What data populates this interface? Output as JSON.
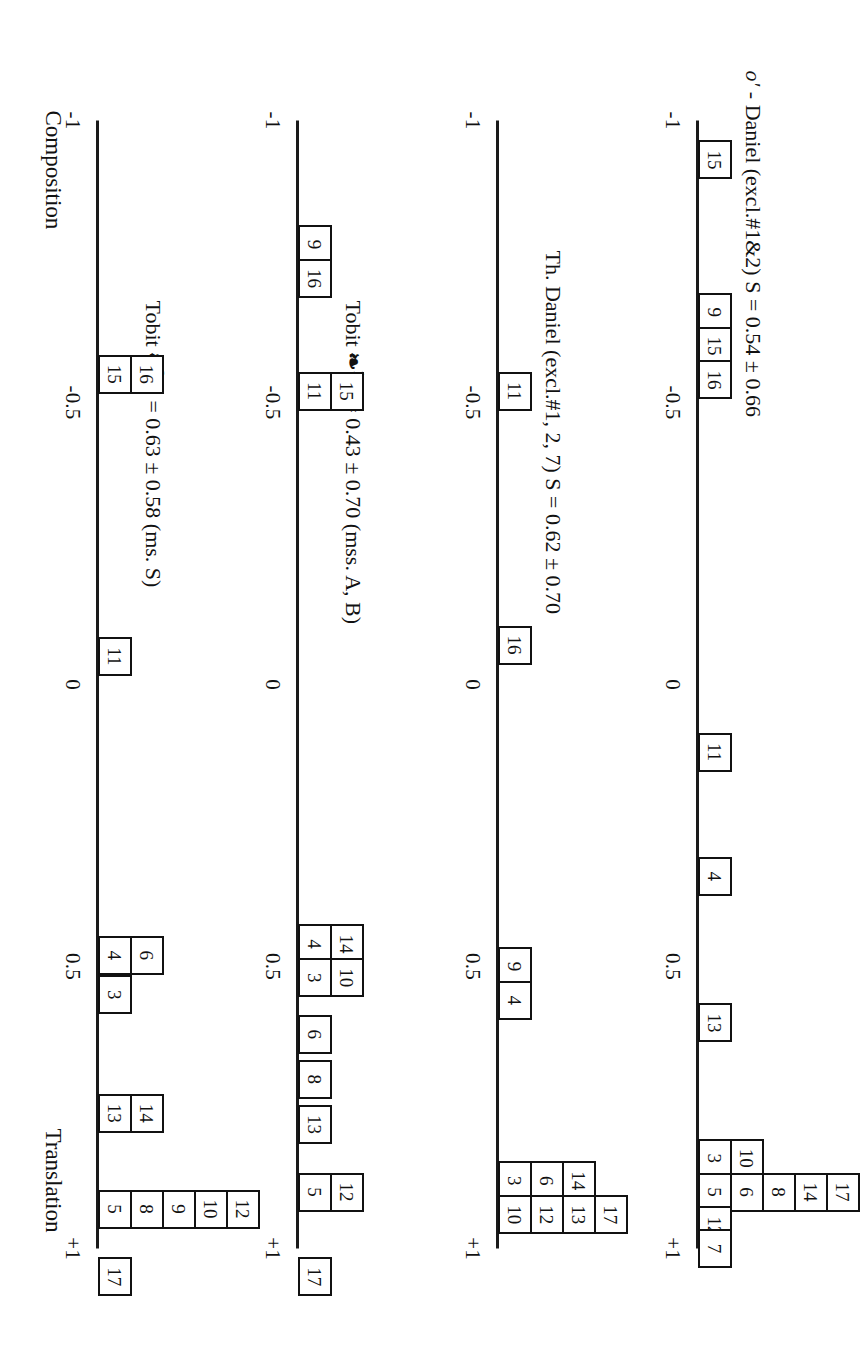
{
  "figure": {
    "orientation_note": "rotated",
    "left_end_label": "Composition",
    "right_end_label": "Translation",
    "axis_ticks": [
      "-1",
      "-0.5",
      "0",
      "0.5",
      "+1"
    ],
    "axis_tick_values": [
      -1,
      -0.5,
      0,
      0.5,
      1
    ]
  },
  "panels": [
    {
      "id": "panel-1",
      "title_prefix": "o′",
      "title_rest": "- Daniel (excl.#1&2)   S =   0.54 ± 0.66",
      "title_full": "o′ - Daniel (excl.#1&2)   S =   0.54 ± 0.66",
      "score": "0.54",
      "sd": "0.66"
    },
    {
      "id": "panel-2",
      "title_prefix": "",
      "title_rest": "Th. Daniel (excl.#1, 2, 7)   S = 0.62  ± 0.70",
      "title_full": "Th. Daniel (excl.#1, 2, 7)   S = 0.62  ± 0.70",
      "score": "0.62",
      "sd": "0.70"
    },
    {
      "id": "panel-3",
      "title_prefix": "Tobit",
      "title_mark": "❧",
      "title_sup": "1",
      "title_rest": "S = 0.43 ± 0.70      (mss. A, B)",
      "title_full": "Tobit ❧1  S = 0.43 ± 0.70      (mss. A, B)",
      "score": "0.43",
      "sd": "0.70",
      "note": "(mss. A, B)"
    },
    {
      "id": "panel-4",
      "title_prefix": "Tobit",
      "title_mark": "❧",
      "title_sup": "2",
      "title_rest": "S = 0.63 ± 0.58     (ms. S)",
      "title_full": "Tobit ❧2  S = 0.63 ± 0.58     (ms. S)",
      "score": "0.63",
      "sd": "0.58",
      "note": "(ms. S)"
    }
  ],
  "chart_data": {
    "type": "bar",
    "xlabel": "",
    "ylabel": "",
    "xlim": [
      -1,
      1
    ],
    "grid": false,
    "legend": "none",
    "xtick_labels": [
      "-1",
      "-0.5",
      "0",
      "0.5",
      "+1"
    ],
    "xtick_values": [
      -1,
      -0.5,
      0,
      0.5,
      1
    ],
    "axis_end_labels": {
      "left": "Composition",
      "right": "Translation"
    },
    "series": [
      {
        "name": "o′ - Daniel (excl.#1&2)",
        "S": 0.54,
        "sd": 0.66,
        "stacks": [
          {
            "x": -0.93,
            "labels": [
              "15"
            ]
          },
          {
            "x": -0.66,
            "labels": [
              "9"
            ]
          },
          {
            "x": -0.6,
            "labels": [
              "15"
            ]
          },
          {
            "x": -0.54,
            "labels": [
              "16"
            ]
          },
          {
            "x": 0.12,
            "labels": [
              "11"
            ]
          },
          {
            "x": 0.34,
            "labels": [
              "4"
            ]
          },
          {
            "x": 0.6,
            "labels": [
              "13"
            ]
          },
          {
            "x": 0.84,
            "labels": [
              "3",
              "10"
            ]
          },
          {
            "x": 0.9,
            "labels": [
              "5",
              "6",
              "8",
              "14",
              "17"
            ]
          },
          {
            "x": 0.96,
            "labels": [
              "12"
            ]
          },
          {
            "x": 1.0,
            "labels": [
              "7"
            ]
          }
        ]
      },
      {
        "name": "Th. Daniel (excl.#1, 2, 7)",
        "S": 0.62,
        "sd": 0.7,
        "stacks": [
          {
            "x": -0.52,
            "labels": [
              "11"
            ]
          },
          {
            "x": -0.07,
            "labels": [
              "16"
            ]
          },
          {
            "x": 0.5,
            "labels": [
              "9"
            ]
          },
          {
            "x": 0.56,
            "labels": [
              "4"
            ]
          },
          {
            "x": 0.88,
            "labels": [
              "3",
              "6",
              "14"
            ]
          },
          {
            "x": 0.94,
            "labels": [
              "10",
              "12",
              "13",
              "17"
            ]
          }
        ]
      },
      {
        "name": "Tobit ❧1 (mss. A, B)",
        "S": 0.43,
        "sd": 0.7,
        "stacks": [
          {
            "x": -0.78,
            "labels": [
              "9"
            ]
          },
          {
            "x": -0.72,
            "labels": [
              "16"
            ]
          },
          {
            "x": -0.52,
            "labels": [
              "11",
              "15"
            ]
          },
          {
            "x": 0.46,
            "labels": [
              "4",
              "14"
            ]
          },
          {
            "x": 0.52,
            "labels": [
              "3",
              "10"
            ]
          },
          {
            "x": 0.62,
            "labels": [
              "6"
            ]
          },
          {
            "x": 0.7,
            "labels": [
              "8"
            ]
          },
          {
            "x": 0.78,
            "labels": [
              "13"
            ]
          },
          {
            "x": 0.9,
            "labels": [
              "5",
              "12"
            ]
          },
          {
            "x": 1.05,
            "labels": [
              "17"
            ]
          }
        ]
      },
      {
        "name": "Tobit ❧2 (ms. S)",
        "S": 0.63,
        "sd": 0.58,
        "stacks": [
          {
            "x": -0.55,
            "labels": [
              "15",
              "16"
            ]
          },
          {
            "x": -0.05,
            "labels": [
              "11"
            ]
          },
          {
            "x": 0.48,
            "labels": [
              "4",
              "6"
            ]
          },
          {
            "x": 0.55,
            "labels": [
              "3"
            ]
          },
          {
            "x": 0.76,
            "labels": [
              "13",
              "14"
            ]
          },
          {
            "x": 0.93,
            "labels": [
              "5",
              "8",
              "9",
              "10",
              "12"
            ]
          },
          {
            "x": 1.05,
            "labels": [
              "17"
            ]
          }
        ]
      }
    ]
  }
}
